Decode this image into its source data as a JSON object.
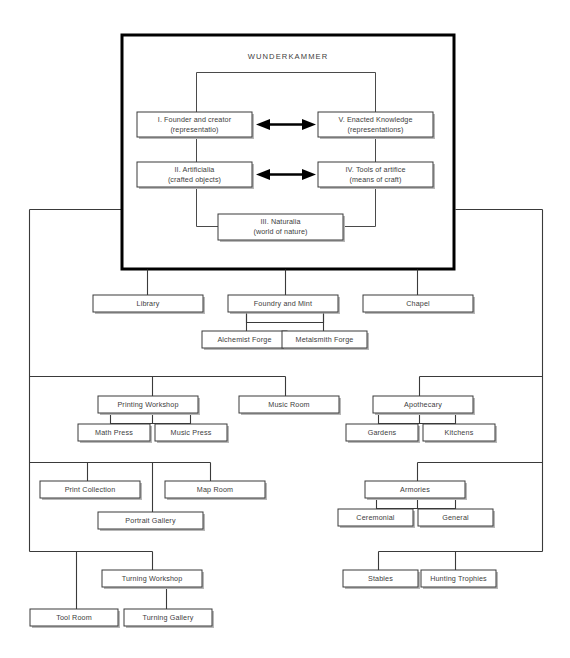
{
  "diagram": {
    "title": "WUNDERKAMMER",
    "type": "hierarchy-diagram",
    "colors": {
      "background": "#ffffff",
      "box_stroke": "#3a3a3a",
      "frame_stroke": "#000000",
      "text": "#3d3d3d",
      "shadow": "#b8b8b8"
    },
    "core": {
      "frame_label": "WUNDERKAMMER",
      "nodes": [
        {
          "id": "founder",
          "line1": "I. Founder and creator",
          "line2": "(representatio)"
        },
        {
          "id": "enacted",
          "line1": "V. Enacted Knowledge",
          "line2": "(representations)"
        },
        {
          "id": "artificialia",
          "line1": "II. Artificialia",
          "line2": "(crafted objects)"
        },
        {
          "id": "tools",
          "line1": "IV. Tools of artifice",
          "line2": "(means of craft)"
        },
        {
          "id": "naturalia",
          "line1": "III. Naturalia",
          "line2": "(world of nature)"
        }
      ],
      "arrows": [
        {
          "from": "founder",
          "to": "enacted",
          "style": "double-headed"
        },
        {
          "from": "artificialia",
          "to": "tools",
          "style": "double-headed"
        }
      ]
    },
    "rows": [
      {
        "id": "row-1",
        "nodes": [
          {
            "id": "library",
            "label": "Library"
          },
          {
            "id": "foundry-and-mint",
            "label": "Foundry and Mint"
          },
          {
            "id": "chapel",
            "label": "Chapel"
          }
        ],
        "children": [
          {
            "id": "alchemist-forge",
            "label": "Alchemist Forge",
            "parent": "foundry-and-mint"
          },
          {
            "id": "metalsmith-forge",
            "label": "Metalsmith Forge",
            "parent": "foundry-and-mint"
          }
        ]
      },
      {
        "id": "row-2",
        "nodes": [
          {
            "id": "printing-workshop",
            "label": "Printing Workshop"
          },
          {
            "id": "music-room",
            "label": "Music Room"
          },
          {
            "id": "apothecary",
            "label": "Apothecary"
          }
        ],
        "children": [
          {
            "id": "math-press",
            "label": "Math Press",
            "parent": "printing-workshop"
          },
          {
            "id": "music-press",
            "label": "Music Press",
            "parent": "printing-workshop"
          },
          {
            "id": "gardens",
            "label": "Gardens",
            "parent": "apothecary"
          },
          {
            "id": "kitchens",
            "label": "Kitchens",
            "parent": "apothecary"
          }
        ]
      },
      {
        "id": "row-3",
        "nodes": [
          {
            "id": "print-collection",
            "label": "Print Collection"
          },
          {
            "id": "map-room",
            "label": "Map Room"
          },
          {
            "id": "armories",
            "label": "Armories"
          }
        ],
        "children": [
          {
            "id": "portrait-gallery",
            "label": "Portrait Gallery",
            "parent": "print-collection"
          },
          {
            "id": "ceremonial",
            "label": "Ceremonial",
            "parent": "armories"
          },
          {
            "id": "general",
            "label": "General",
            "parent": "armories"
          }
        ]
      },
      {
        "id": "row-4",
        "nodes": [
          {
            "id": "turning-workshop",
            "label": "Turning Workshop"
          },
          {
            "id": "stables",
            "label": "Stables"
          },
          {
            "id": "hunting-trophies",
            "label": "Hunting Trophies"
          }
        ],
        "children": [
          {
            "id": "tool-room",
            "label": "Tool Room",
            "parent": "turning-workshop"
          },
          {
            "id": "turning-gallery",
            "label": "Turning Gallery",
            "parent": "turning-workshop"
          }
        ]
      }
    ]
  }
}
